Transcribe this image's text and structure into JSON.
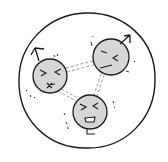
{
  "illustration": {
    "description": "Hand-drawn sketch of three angry/stressed faces inside a circle, connected by dashed double lines forming a triangle",
    "colors": {
      "ink": "#1a1a1a",
      "face_fill": "#d4d4d4",
      "background": "#ffffff",
      "link": "#9a9a9a"
    },
    "outer_circle": {
      "cx": 86,
      "cy": 80,
      "r": 68
    },
    "faces": [
      {
        "name": "left-face",
        "cx": 50,
        "cy": 75,
        "r": 17,
        "expression": "angry-squint",
        "arrow": "up-left"
      },
      {
        "name": "right-face",
        "cx": 111,
        "cy": 57,
        "r": 18,
        "expression": "annoyed",
        "arrow": "up-right"
      },
      {
        "name": "bottom-face",
        "cx": 90,
        "cy": 112,
        "r": 17,
        "expression": "shouting",
        "arrow": "none"
      }
    ],
    "links": [
      {
        "from": "left-face",
        "to": "right-face"
      },
      {
        "from": "left-face",
        "to": "bottom-face"
      },
      {
        "from": "right-face",
        "to": "bottom-face"
      }
    ]
  }
}
